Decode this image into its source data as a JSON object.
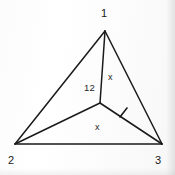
{
  "figure": {
    "kind": "geometry-diagram",
    "background_color": "#fdfdfd",
    "stroke_color": "#1a1a1a",
    "text_color": "#1a1a1a"
  },
  "vertices": [
    {
      "id": "v1",
      "label": "1",
      "x": 105,
      "y": 31,
      "label_x": 101,
      "label_y": 8
    },
    {
      "id": "v2",
      "label": "2",
      "x": 15,
      "y": 144,
      "label_x": 8,
      "label_y": 155
    },
    {
      "id": "v3",
      "label": "3",
      "x": 162,
      "y": 144,
      "label_x": 155,
      "label_y": 155
    }
  ],
  "interior_point": {
    "id": "p",
    "x": 100,
    "y": 103
  },
  "edges": [
    {
      "id": "e-1-2",
      "from": "v1",
      "to": "v2"
    },
    {
      "id": "e-1-3",
      "from": "v1",
      "to": "v3"
    },
    {
      "id": "e-2-3",
      "from": "v2",
      "to": "v3"
    },
    {
      "id": "e-p-1",
      "from": "p",
      "to": "v1"
    },
    {
      "id": "e-p-2",
      "from": "p",
      "to": "v2"
    },
    {
      "id": "e-p-3",
      "from": "p",
      "to": "v3"
    }
  ],
  "annotations": {
    "center_number": "12",
    "segment_label_upper": "x",
    "segment_label_lower": "x",
    "tick_mark": {
      "on_edge": "e-p-3",
      "x": 123,
      "y": 113,
      "count": 1
    }
  }
}
